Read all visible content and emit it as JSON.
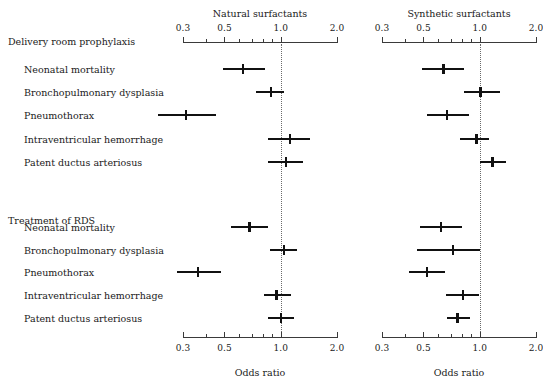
{
  "chart_data": {
    "type": "scatter",
    "plot_kind": "forest-plot",
    "title": "",
    "xlabel": "Odds ratio",
    "ylabel": "",
    "xscale": "log",
    "xlim": [
      0.3,
      2.0
    ],
    "xticks_major": [
      0.3,
      0.5,
      1.0,
      2.0
    ],
    "xticks_major_labels": [
      "0.3",
      "0.5",
      "1.0",
      "2.0"
    ],
    "xticks_minor": [
      0.4,
      0.6,
      0.7,
      0.8,
      0.9
    ],
    "reference_line": 1.0,
    "grid": false,
    "legend": "none",
    "panels": [
      {
        "column_title": "Natural surfactants",
        "section": "Delivery room prophylaxis",
        "outcomes": [
          "Neonatal mortality",
          "Bronchopulmonary dysplasia",
          "Pneumothorax",
          "Intraventricular hemorrhage",
          "Patent ductus arteriosus"
        ],
        "odds_ratio": [
          0.63,
          0.89,
          0.31,
          1.12,
          1.07
        ],
        "ci_low": [
          0.49,
          0.74,
          0.22,
          0.86,
          0.85
        ],
        "ci_high": [
          0.82,
          1.04,
          0.45,
          1.44,
          1.32
        ]
      },
      {
        "column_title": "Synthetic surfactants",
        "section": "Delivery room prophylaxis",
        "outcomes": [
          "Neonatal mortality",
          "Bronchopulmonary dysplasia",
          "Pneumothorax",
          "Intraventricular hemorrhage",
          "Patent ductus arteriosus"
        ],
        "odds_ratio": [
          0.64,
          1.01,
          0.67,
          0.96,
          1.17
        ],
        "ci_low": [
          0.49,
          0.82,
          0.52,
          0.78,
          1.0
        ],
        "ci_high": [
          0.82,
          1.29,
          0.88,
          1.12,
          1.38
        ]
      },
      {
        "column_title": "Natural surfactants",
        "section": "Treatment of RDS",
        "outcomes": [
          "Neonatal mortality",
          "Bronchopulmonary dysplasia",
          "Pneumothorax",
          "Intraventricular hemorrhage",
          "Patent ductus arteriosus"
        ],
        "odds_ratio": [
          0.68,
          1.04,
          0.36,
          0.95,
          1.0
        ],
        "ci_low": [
          0.54,
          0.88,
          0.28,
          0.81,
          0.85
        ],
        "ci_high": [
          0.86,
          1.22,
          0.48,
          1.13,
          1.18
        ]
      },
      {
        "column_title": "Synthetic surfactants",
        "section": "Treatment of RDS",
        "outcomes": [
          "Neonatal mortality",
          "Bronchopulmonary dysplasia",
          "Pneumothorax",
          "Intraventricular hemorrhage",
          "Patent ductus arteriosus"
        ],
        "odds_ratio": [
          0.62,
          0.72,
          0.52,
          0.81,
          0.76
        ],
        "ci_low": [
          0.48,
          0.46,
          0.42,
          0.66,
          0.67
        ],
        "ci_high": [
          0.8,
          1.0,
          0.65,
          0.99,
          0.89
        ]
      }
    ]
  },
  "headers": {
    "natural": "Natural surfactants",
    "synthetic": "Synthetic surfactants"
  },
  "sections": [
    {
      "name": "Delivery room prophylaxis",
      "rows": [
        "Neonatal mortality",
        "Bronchopulmonary dysplasia",
        "Pneumothorax",
        "Intraventricular hemorrhage",
        "Patent ductus arteriosus"
      ]
    },
    {
      "name": "Treatment of RDS",
      "rows": [
        "Neonatal mortality",
        "Bronchopulmonary dysplasia",
        "Pneumothorax",
        "Intraventricular hemorrhage",
        "Patent ductus arteriosus"
      ]
    }
  ],
  "axis": {
    "xlabel_left": "Odds ratio",
    "xlabel_right": "Odds ratio",
    "tick_labels": [
      "0.3",
      "0.5",
      "1.0",
      "2.0"
    ]
  }
}
